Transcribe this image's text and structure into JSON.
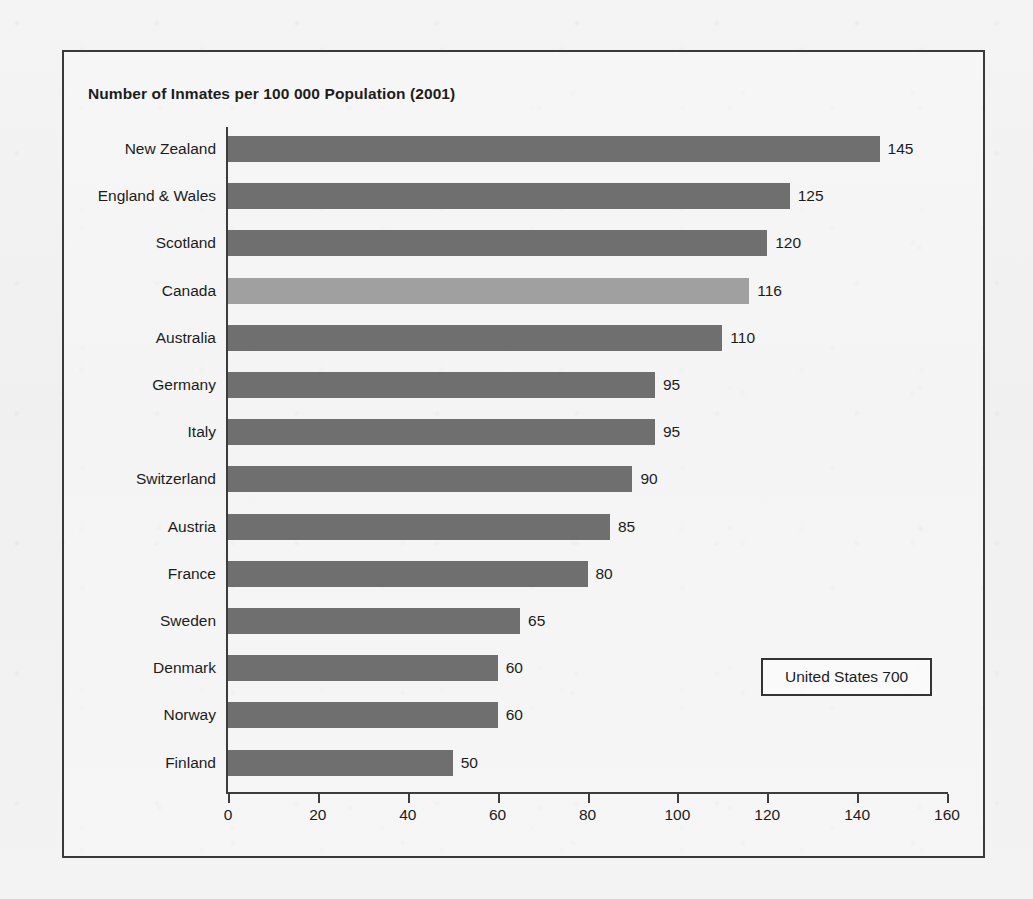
{
  "chart_data": {
    "type": "bar",
    "orientation": "horizontal",
    "title": "Number of Inmates per 100 000 Population (2001)",
    "xlabel": "",
    "ylabel": "",
    "xlim": [
      0,
      160
    ],
    "xticks": [
      0,
      20,
      40,
      60,
      80,
      100,
      120,
      140,
      160
    ],
    "grid": false,
    "legend": "none",
    "categories": [
      "New Zealand",
      "England & Wales",
      "Scotland",
      "Canada",
      "Australia",
      "Germany",
      "Italy",
      "Switzerland",
      "Austria",
      "France",
      "Sweden",
      "Denmark",
      "Norway",
      "Finland"
    ],
    "values": [
      145,
      125,
      120,
      116,
      110,
      95,
      95,
      90,
      85,
      80,
      65,
      60,
      60,
      50
    ],
    "value_labels": [
      "145",
      "125",
      "120",
      "116",
      "110",
      "95",
      "95",
      "90",
      "85",
      "80",
      "65",
      "60",
      "60",
      "50"
    ],
    "highlight_category": "Canada",
    "bar_color": "#6f6f6f",
    "highlight_color": "#a0a0a0",
    "annotation": {
      "label": "United States  700",
      "country": "United States",
      "value": 700
    }
  }
}
